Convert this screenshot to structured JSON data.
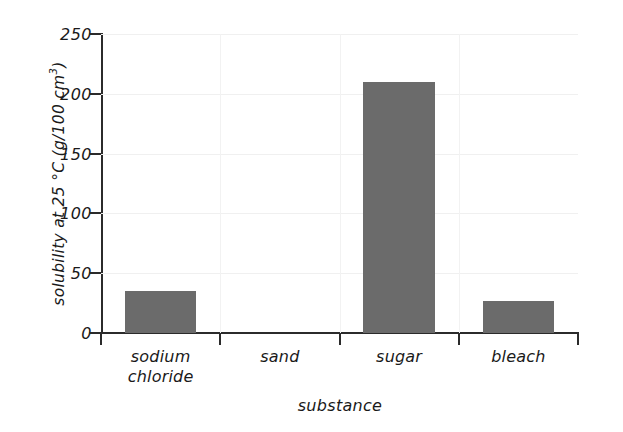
{
  "chart_data": {
    "type": "bar",
    "title": "",
    "categories": [
      "sodium chloride",
      "sand",
      "sugar",
      "bleach"
    ],
    "category_lines": [
      [
        "sodium",
        "chloride"
      ],
      [
        "sand",
        ""
      ],
      [
        "sugar",
        ""
      ],
      [
        "bleach",
        ""
      ]
    ],
    "values": [
      35,
      0,
      210,
      27
    ],
    "xlabel": "substance",
    "ylabel": "solubility at 25 °C (g/100 cm³)",
    "ylabel_main": "solubility at 25 °C (g/100 cm",
    "ylabel_sup": "3",
    "ylabel_tail": ")",
    "ylim": [
      0,
      250
    ],
    "ytick_labels": [
      "0",
      "50",
      "100",
      "150",
      "200",
      "250"
    ],
    "ytick_values": [
      0,
      50,
      100,
      150,
      200,
      250
    ],
    "grid": true,
    "legend": "none",
    "bar_color": "#6b6b6b",
    "axis_color": "#2b2b2b",
    "grid_color": "#f0f0f0",
    "background": "#ffffff"
  }
}
